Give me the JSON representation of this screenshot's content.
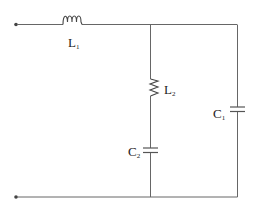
{
  "diagram": {
    "type": "circuit",
    "background": "#ffffff",
    "wire_color": "#555555",
    "components": [
      {
        "id": "L1",
        "kind": "inductor",
        "label": "L",
        "subscript": "1",
        "position": "top wire, series"
      },
      {
        "id": "L2",
        "kind": "inductor",
        "label": "L",
        "subscript": "2",
        "position": "middle branch, upper"
      },
      {
        "id": "C2",
        "kind": "capacitor",
        "label": "C",
        "subscript": "2",
        "position": "middle branch, lower"
      },
      {
        "id": "C1",
        "kind": "capacitor",
        "label": "C",
        "subscript": "1",
        "position": "right branch"
      }
    ],
    "terminals": [
      {
        "id": "t-top",
        "position": "left top"
      },
      {
        "id": "t-bottom",
        "position": "left bottom"
      }
    ]
  },
  "labels": {
    "l1": {
      "main": "L",
      "sub": "1"
    },
    "l2": {
      "main": "L",
      "sub": "2"
    },
    "c1": {
      "main": "C",
      "sub": "1"
    },
    "c2": {
      "main": "C",
      "sub": "2"
    }
  }
}
